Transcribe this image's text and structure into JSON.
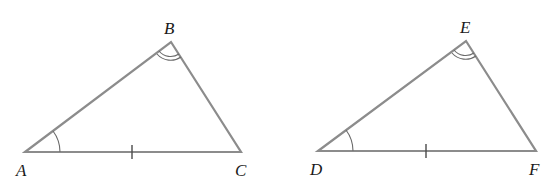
{
  "figure": {
    "line_color": "#8c8c8c",
    "triangles": [
      {
        "name": "triangle-abc",
        "vertices": {
          "A": {
            "label": "A",
            "x": 25,
            "y": 152
          },
          "B": {
            "label": "B",
            "x": 171,
            "y": 42
          },
          "C": {
            "label": "C",
            "x": 241,
            "y": 152
          }
        },
        "markings": {
          "angle_A": "single arc",
          "angle_B": "double arc",
          "side_AC": "single tick"
        }
      },
      {
        "name": "triangle-def",
        "vertices": {
          "D": {
            "label": "D",
            "x": 318,
            "y": 151
          },
          "E": {
            "label": "E",
            "x": 466,
            "y": 41
          },
          "F": {
            "label": "F",
            "x": 536,
            "y": 151
          }
        },
        "markings": {
          "angle_D": "single arc",
          "angle_E": "double arc",
          "side_DF": "single tick"
        }
      }
    ]
  },
  "labels": {
    "A": "A",
    "B": "B",
    "C": "C",
    "D": "D",
    "E": "E",
    "F": "F"
  }
}
